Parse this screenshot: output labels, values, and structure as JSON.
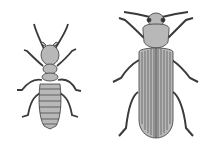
{
  "image": {
    "description": "Black-and-white line illustration of two insects side by side: a termite (left) and a beetle (right)",
    "subjects": [
      {
        "name": "termite",
        "position": "left"
      },
      {
        "name": "beetle",
        "position": "right"
      }
    ],
    "colors": {
      "background": "#ffffff",
      "body_fill": "#b8b8b8",
      "outline": "#3a3a3a"
    }
  }
}
